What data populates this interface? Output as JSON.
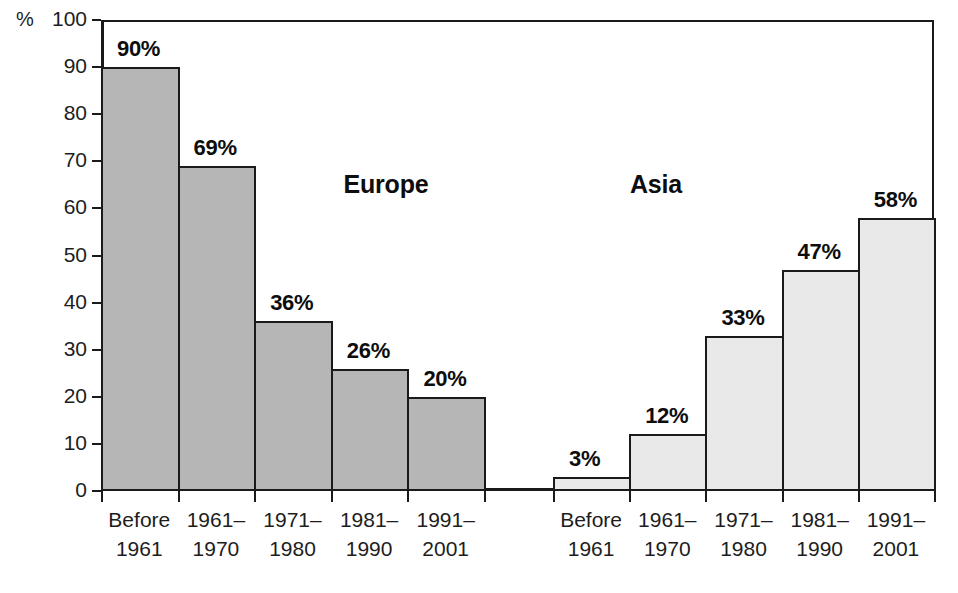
{
  "chart_data": {
    "type": "bar",
    "title": "",
    "subtitle": "",
    "xlabel": "",
    "ylabel": "%",
    "ylim": [
      0,
      100
    ],
    "ytick_values": [
      100,
      90,
      80,
      70,
      60,
      50,
      40,
      30,
      20,
      10,
      0
    ],
    "ytick_labels": [
      "100",
      "90",
      "80",
      "70",
      "60",
      "50",
      "40",
      "30",
      "20",
      "10",
      "0"
    ],
    "grid": false,
    "legend_position": "in-plot-annotations",
    "categories": [
      "Before 1961",
      "1961–1970",
      "1971–1980",
      "1981–1990",
      "1991–2001"
    ],
    "category_lines": [
      {
        "line1": "Before",
        "line2": "1961"
      },
      {
        "line1": "1961–",
        "line2": "1970"
      },
      {
        "line1": "1971–",
        "line2": "1980"
      },
      {
        "line1": "1981–",
        "line2": "1990"
      },
      {
        "line1": "1991–",
        "line2": "2001"
      }
    ],
    "series": [
      {
        "name": "Europe",
        "color": "#b6b6b6",
        "values": [
          90,
          69,
          36,
          26,
          20
        ],
        "value_labels": [
          "90%",
          "69%",
          "36%",
          "26%",
          "20%"
        ]
      },
      {
        "name": "Asia",
        "color": "#e9e9e9",
        "values": [
          3,
          12,
          33,
          47,
          58
        ],
        "value_labels": [
          "3%",
          "12%",
          "33%",
          "47%",
          "58%"
        ]
      }
    ]
  },
  "axis": {
    "unit_label": "%",
    "border_color": "#1a1a1a",
    "text_color": "#1d1d1d"
  },
  "groups": [
    {
      "label": "Europe"
    },
    {
      "label": "Asia"
    }
  ]
}
